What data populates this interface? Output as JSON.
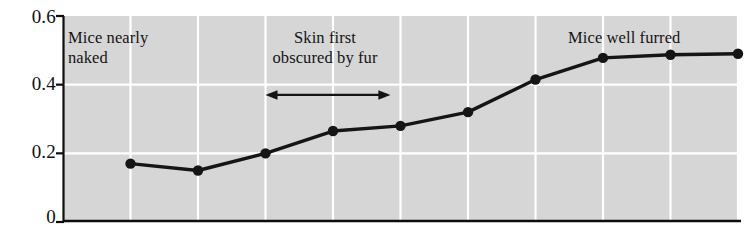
{
  "chart_data": {
    "type": "line",
    "title": "",
    "xlabel": "",
    "ylabel": "",
    "ylim": [
      0,
      0.6
    ],
    "xlim": [
      0,
      10
    ],
    "grid": true,
    "legend": null,
    "plot_background": "#d6d6d6",
    "gridline_color": "#ffffff",
    "series_color": "#151515",
    "marker": "circle",
    "y_ticks": [
      "0",
      "0.2",
      "0.4",
      "0.6"
    ],
    "y_tick_values": [
      0,
      0.2,
      0.4,
      0.6
    ],
    "x_ticks": [],
    "x": [
      1,
      2,
      3,
      4,
      5,
      6,
      7,
      8,
      9,
      10
    ],
    "values": [
      0.17,
      0.15,
      0.2,
      0.265,
      0.28,
      0.32,
      0.415,
      0.478,
      0.487,
      0.49
    ],
    "series": [
      {
        "name": "fur growth",
        "values": [
          0.17,
          0.15,
          0.2,
          0.265,
          0.28,
          0.32,
          0.415,
          0.478,
          0.487,
          0.49
        ]
      }
    ],
    "annotations": [
      {
        "id": "left",
        "text": "Mice nearly\nnaked"
      },
      {
        "id": "mid",
        "text": "Skin first\nobscured by fur"
      },
      {
        "id": "right",
        "text": "Mice well furred"
      }
    ],
    "arrow": {
      "id": "span-arrow",
      "label": "",
      "double_headed": true,
      "x_start": 3,
      "x_end": 4.85,
      "y": 0.37
    }
  }
}
